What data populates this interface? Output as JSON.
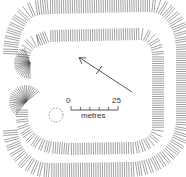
{
  "figure": {
    "type": "archaeological earthwork plan (hachured)",
    "features": [
      "outer-bank",
      "inner-bank",
      "entrance-gap",
      "interior-enclosure",
      "pit-circle-dashed",
      "north-arrow"
    ]
  },
  "scale_bar": {
    "start_label": "0",
    "end_label": "25",
    "unit_label": "metres"
  },
  "colors": {
    "ink": "#444444",
    "background": "#ffffff"
  }
}
